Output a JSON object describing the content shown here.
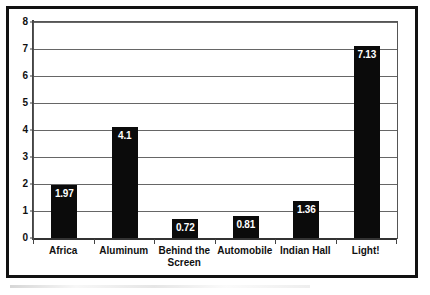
{
  "chart_data": {
    "type": "bar",
    "title": "",
    "subtitle": "",
    "xlabel": "",
    "ylabel": "",
    "categories": [
      "Africa",
      "Behind the Screen",
      "Aluminum",
      "Automobile",
      "Indian Hall",
      "Light!"
    ],
    "category_order": [
      "Africa",
      "Aluminum",
      "Behind the Screen",
      "Automobile",
      "Indian Hall",
      "Light!"
    ],
    "values": [
      1.97,
      4.1,
      0.72,
      0.81,
      1.36,
      7.13
    ],
    "bars": [
      {
        "label": "Africa",
        "value": 1.97,
        "value_text": "1.97"
      },
      {
        "label": "Aluminum",
        "value": 4.1,
        "value_text": "4.1"
      },
      {
        "label": "Behind the Screen",
        "value": 0.72,
        "value_text": "0.72"
      },
      {
        "label": "Automobile",
        "value": 0.81,
        "value_text": "0.81"
      },
      {
        "label": "Indian Hall",
        "value": 1.36,
        "value_text": "1.36"
      },
      {
        "label": "Light!",
        "value": 7.13,
        "value_text": "7.13"
      }
    ],
    "ylim": [
      0,
      8
    ],
    "ytick_labels": [
      "0",
      "1",
      "2",
      "3",
      "4",
      "5",
      "6",
      "7",
      "8"
    ],
    "ytick_values": [
      0,
      1,
      2,
      3,
      4,
      5,
      6,
      7,
      8
    ],
    "grid": true,
    "grid_axis": "y",
    "legend": false,
    "legend_position": "none",
    "bar_color": "#0b0b0b",
    "value_label_color": "#ffffff",
    "grid_color": "#666666",
    "background_color": "#ffffff"
  }
}
